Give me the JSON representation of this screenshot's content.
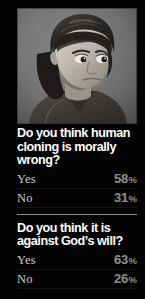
{
  "theme": {
    "background": "#030303",
    "question_color": "#ffffff",
    "label_color": "#c9c9c9",
    "value_color": "#8e8e8e",
    "divider_color": "#8b8b8b"
  },
  "photo": {
    "alt": "black-and-white studio portrait of a young boy with dark bowl-cut hair looking to the side against a mottled gray backdrop",
    "type": "grayscale-portrait-photograph"
  },
  "polls": [
    {
      "question": "Do you think human cloning is morally wrong?",
      "rows": [
        {
          "label": "Yes",
          "value": "58",
          "unit": "%"
        },
        {
          "label": "No",
          "value": "31",
          "unit": "%"
        }
      ]
    },
    {
      "question": "Do you think it is against God’s will?",
      "rows": [
        {
          "label": "Yes",
          "value": "63",
          "unit": "%"
        },
        {
          "label": "No",
          "value": "26",
          "unit": "%"
        }
      ]
    }
  ]
}
